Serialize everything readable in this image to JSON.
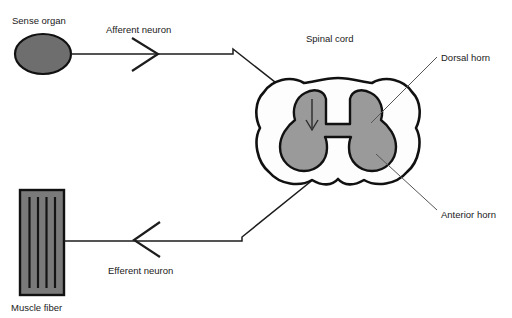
{
  "diagram": {
    "labels": {
      "sense_organ": "Sense organ",
      "afferent_neuron": "Afferent neuron",
      "spinal_cord": "Spinal cord",
      "dorsal_horn": "Dorsal horn",
      "anterior_horn": "Anterior horn",
      "efferent_neuron": "Efferent neuron",
      "muscle_fiber": "Muscle fiber"
    },
    "colors": {
      "background": "#ffffff",
      "outline": "#111111",
      "sense_organ_fill": "#6e6e6e",
      "muscle_fiber_fill": "#7a7a7a",
      "muscle_fiber_stripe": "#151515",
      "gray_matter_fill": "#9a9a9a",
      "white_matter_fill": "#fdfdfd",
      "leader_line": "#555555",
      "text": "#1a1a1a"
    },
    "structures": {
      "sense_organ": {
        "shape": "ellipse",
        "cx": 43,
        "cy": 54,
        "rx": 28,
        "ry": 20
      },
      "muscle_fiber": {
        "shape": "rect",
        "x": 20,
        "y": 190,
        "width": 44,
        "height": 105,
        "stripes": 4
      },
      "spinal_cord": {
        "shape": "cross-section",
        "cx": 338,
        "cy": 134,
        "rx": 82,
        "ry": 56
      }
    },
    "pathways": [
      {
        "name": "afferent",
        "direction": "right",
        "from": "sense organ",
        "to": "dorsal horn"
      },
      {
        "name": "efferent",
        "direction": "left",
        "from": "anterior horn",
        "to": "muscle fiber"
      }
    ]
  }
}
